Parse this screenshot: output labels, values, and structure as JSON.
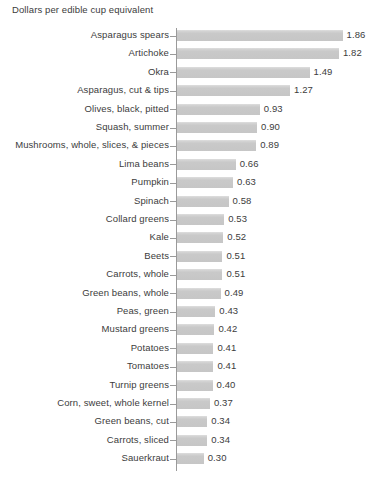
{
  "chart": {
    "title": "Dollars per edible cup equivalent"
  },
  "chart_data": {
    "type": "bar",
    "orientation": "horizontal",
    "title": "Dollars per edible cup equivalent",
    "xlabel": "",
    "ylabel": "",
    "xlim": [
      0,
      1.86
    ],
    "grid": false,
    "legend": false,
    "bar_color": "#c8c8c8",
    "axis_color": "#9a9a9a",
    "text_color": "#3c3c3c",
    "background": "#ffffff",
    "value_format": "0.00",
    "categories": [
      "Asparagus spears",
      "Artichoke",
      "Okra",
      "Asparagus, cut & tips",
      "Olives, black, pitted",
      "Squash, summer",
      "Mushrooms, whole, slices, & pieces",
      "Lima beans",
      "Pumpkin",
      "Spinach",
      "Collard greens",
      "Kale",
      "Beets",
      "Carrots, whole",
      "Green beans, whole",
      "Peas, green",
      "Mustard greens",
      "Potatoes",
      "Tomatoes",
      "Turnip greens",
      "Corn, sweet, whole kernel",
      "Green beans, cut",
      "Carrots, sliced",
      "Sauerkraut"
    ],
    "values": [
      1.86,
      1.82,
      1.49,
      1.27,
      0.93,
      0.9,
      0.89,
      0.66,
      0.63,
      0.58,
      0.53,
      0.52,
      0.51,
      0.51,
      0.49,
      0.43,
      0.42,
      0.41,
      0.41,
      0.4,
      0.37,
      0.34,
      0.34,
      0.3
    ],
    "value_labels": [
      "1.86",
      "1.82",
      "1.49",
      "1.27",
      "0.93",
      "0.90",
      "0.89",
      "0.66",
      "0.63",
      "0.58",
      "0.53",
      "0.52",
      "0.51",
      "0.51",
      "0.49",
      "0.43",
      "0.42",
      "0.41",
      "0.41",
      "0.40",
      "0.37",
      "0.34",
      "0.34",
      "0.30"
    ]
  }
}
